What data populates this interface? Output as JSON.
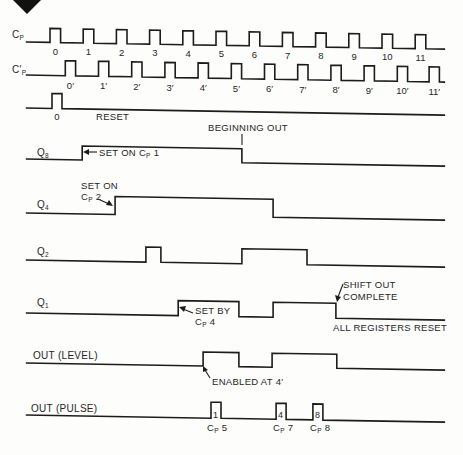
{
  "corner_mark": {
    "icon": "diamond-icon"
  },
  "time_axis": {
    "unit": "clock period",
    "range": [
      -0.73,
      11.9
    ]
  },
  "signals": [
    {
      "id": "cp",
      "label": {
        "main": "C",
        "sub": "P"
      },
      "kind": "clock",
      "pulse_width": 0.32,
      "pulses": [
        {
          "t": 0,
          "label": "0"
        },
        {
          "t": 1,
          "label": "1"
        },
        {
          "t": 2,
          "label": "2"
        },
        {
          "t": 3,
          "label": "3"
        },
        {
          "t": 4,
          "label": "4"
        },
        {
          "t": 5,
          "label": "5"
        },
        {
          "t": 6,
          "label": "6"
        },
        {
          "t": 7,
          "label": "7"
        },
        {
          "t": 8,
          "label": "8"
        },
        {
          "t": 9,
          "label": "9"
        },
        {
          "t": 10,
          "label": "10"
        },
        {
          "t": 11,
          "label": "11"
        }
      ]
    },
    {
      "id": "cp-prime",
      "label": {
        "main": "C′",
        "sub": "P"
      },
      "kind": "clock",
      "pulse_width": 0.31,
      "pulses": [
        {
          "t": 0.46,
          "label": "0′"
        },
        {
          "t": 1.46,
          "label": "1′"
        },
        {
          "t": 2.46,
          "label": "2′"
        },
        {
          "t": 3.46,
          "label": "3′"
        },
        {
          "t": 4.46,
          "label": "4′"
        },
        {
          "t": 5.46,
          "label": "5′"
        },
        {
          "t": 6.46,
          "label": "6′"
        },
        {
          "t": 7.46,
          "label": "7′"
        },
        {
          "t": 8.46,
          "label": "8′"
        },
        {
          "t": 9.46,
          "label": "9′"
        },
        {
          "t": 10.46,
          "label": "10′"
        },
        {
          "t": 11.42,
          "label": "11′"
        }
      ]
    },
    {
      "id": "reset",
      "label": {
        "main": "",
        "sub": ""
      },
      "kind": "clock",
      "pulse_width": 0.3,
      "pulses": [
        {
          "t": 0.06,
          "label": "0"
        }
      ]
    },
    {
      "id": "q8",
      "label": {
        "main": "Q",
        "sub": "8"
      },
      "kind": "level",
      "initial": 0,
      "edges": [
        {
          "t": 0.97,
          "level": 1
        },
        {
          "t": 5.78,
          "level": 0
        }
      ]
    },
    {
      "id": "q4",
      "label": {
        "main": "Q",
        "sub": "4"
      },
      "kind": "level",
      "initial": 0,
      "edges": [
        {
          "t": 1.96,
          "level": 1
        },
        {
          "t": 6.72,
          "level": 0
        }
      ]
    },
    {
      "id": "q2",
      "label": {
        "main": "Q",
        "sub": "2"
      },
      "kind": "level",
      "initial": 0,
      "edges": [
        {
          "t": 2.89,
          "level": 1
        },
        {
          "t": 3.34,
          "level": 0
        },
        {
          "t": 5.78,
          "level": 1
        },
        {
          "t": 7.74,
          "level": 0
        }
      ]
    },
    {
      "id": "q1",
      "label": {
        "main": "Q",
        "sub": "1"
      },
      "kind": "level",
      "initial": 0,
      "edges": [
        {
          "t": 3.86,
          "level": 1
        },
        {
          "t": 5.69,
          "level": 0
        },
        {
          "t": 6.72,
          "level": 1
        },
        {
          "t": 8.61,
          "level": 0
        }
      ]
    },
    {
      "id": "out-level",
      "label": {
        "main": "OUT (LEVEL)",
        "sub": ""
      },
      "kind": "level",
      "initial": 0,
      "edges": [
        {
          "t": 4.61,
          "level": 1
        },
        {
          "t": 5.69,
          "level": 0
        },
        {
          "t": 6.69,
          "level": 1
        },
        {
          "t": 8.64,
          "level": 0
        }
      ]
    },
    {
      "id": "out-pulse",
      "label": {
        "main": "OUT (PULSE)",
        "sub": ""
      },
      "kind": "level",
      "initial": 0,
      "edges": [
        {
          "t": 4.85,
          "level": 1
        },
        {
          "t": 5.15,
          "level": 0
        },
        {
          "t": 6.81,
          "level": 1
        },
        {
          "t": 7.11,
          "level": 0
        },
        {
          "t": 7.92,
          "level": 1
        },
        {
          "t": 8.22,
          "level": 0
        }
      ]
    }
  ],
  "annotations": {
    "reset": "RESET",
    "beginning_out": "BEGINNING OUT",
    "set_on_cp1": {
      "pre": "SET ON C",
      "sub": "P",
      "post": " 1"
    },
    "set_on_cp2": {
      "line1": "SET ON",
      "main": "C",
      "sub": "P",
      "post": " 2"
    },
    "set_by_cp4": {
      "line1": "SET BY",
      "main": "C",
      "sub": "P",
      "post": " 4"
    },
    "shift_out_complete": {
      "line1": "SHIFT OUT",
      "line2": "COMPLETE"
    },
    "all_registers_reset": "ALL REGISTERS RESET",
    "enabled_at": "ENABLED AT 4′",
    "out_pulses": [
      {
        "inner": "1",
        "main": "C",
        "sub": "P",
        "post": " 5"
      },
      {
        "inner": "4",
        "main": "C",
        "sub": "P",
        "post": " 7"
      },
      {
        "inner": "8",
        "main": "C",
        "sub": "P",
        "post": " 8"
      }
    ]
  }
}
